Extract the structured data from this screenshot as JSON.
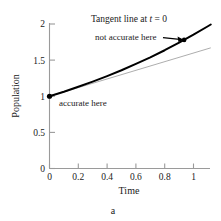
{
  "figure": {
    "caption": "a",
    "background_color": "#ffffff"
  },
  "chart_data": {
    "type": "line",
    "title": "Tangent line at t = 0",
    "title_parts": {
      "prefix": "Tangent line at ",
      "variable": "t",
      "suffix": " = 0"
    },
    "xlabel": "Time",
    "ylabel": "Population",
    "xlim": [
      0,
      1.12
    ],
    "ylim": [
      0,
      2.05
    ],
    "xticks": [
      "0",
      "0.2",
      "0.4",
      "0.6",
      "0.8",
      "1"
    ],
    "xtick_values": [
      0,
      0.2,
      0.4,
      0.6,
      0.8,
      1
    ],
    "yticks": [
      "0",
      "0.5",
      "1",
      "1.5",
      "2"
    ],
    "ytick_values": [
      0,
      0.5,
      1,
      1.5,
      2
    ],
    "grid": false,
    "legend": null,
    "series": [
      {
        "name": "population curve",
        "style": "solid-thick-black",
        "color": "#000000",
        "linewidth": 2.0,
        "x": [
          0.0,
          0.1,
          0.2,
          0.3,
          0.4,
          0.5,
          0.6,
          0.7,
          0.8,
          0.9,
          1.0,
          1.1,
          1.12
        ],
        "y": [
          1.0,
          1.063,
          1.131,
          1.203,
          1.279,
          1.36,
          1.447,
          1.539,
          1.637,
          1.741,
          1.852,
          1.969,
          1.993
        ]
      },
      {
        "name": "tangent line at t = 0",
        "style": "solid-thin-gray",
        "color": "#8a8a8a",
        "linewidth": 0.7,
        "x": [
          0.0,
          1.12
        ],
        "y": [
          1.0,
          1.67
        ]
      }
    ],
    "points": [
      {
        "name": "accurate-point",
        "x": 0.0,
        "y": 1.0,
        "marker": "dot",
        "color": "#000000"
      },
      {
        "name": "not-accurate-point",
        "x": 0.935,
        "y": 1.78,
        "marker": "dot",
        "color": "#000000"
      }
    ],
    "annotations": [
      {
        "name": "accurate-here",
        "text": "accurate here",
        "x": 0.09,
        "y": 0.93,
        "anchor": "start"
      },
      {
        "name": "not-accurate-here",
        "text": "not accurate here",
        "x": 0.33,
        "y": 1.86,
        "anchor": "start",
        "leader_line": {
          "from_x": 0.79,
          "from_y": 1.83,
          "to_x": 0.92,
          "to_y": 1.79
        }
      }
    ],
    "axis_color": "#9a9a9a",
    "text_color": "#1a1a1a"
  }
}
